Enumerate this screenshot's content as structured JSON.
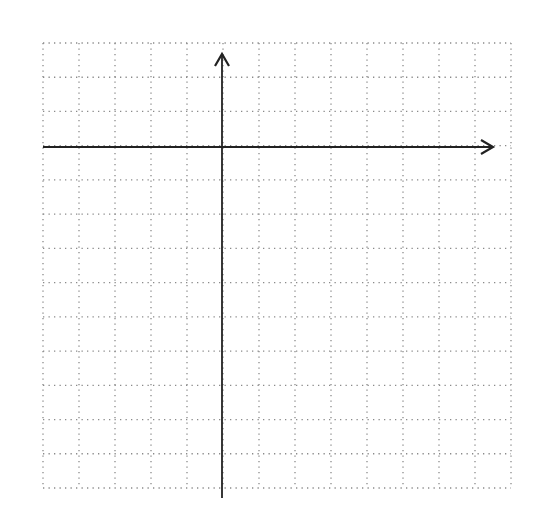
{
  "diagram": {
    "type": "coordinate-grid",
    "grid": {
      "left": 43,
      "top": 43,
      "right": 511,
      "bottom": 488,
      "cols": 13,
      "rows": 13,
      "line_color": "#8a8a8a",
      "style": "dotted"
    },
    "x_axis": {
      "y": 147,
      "x_start": 43,
      "x_end": 493,
      "arrow": "right"
    },
    "y_axis": {
      "x": 222,
      "y_start": 498,
      "y_end": 54,
      "arrow": "up"
    },
    "axis_color": "#222222"
  }
}
